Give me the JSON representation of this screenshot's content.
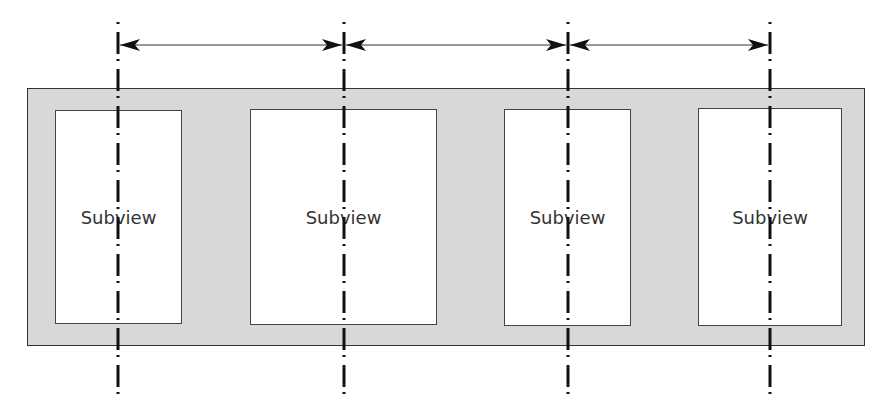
{
  "diagram": {
    "container": {
      "name": "superview",
      "fill": "#d8d8d8",
      "border": "#333333",
      "x": 27,
      "y": 88,
      "width": 838,
      "height": 258
    },
    "subviews": [
      {
        "label": "Subview",
        "x": 55,
        "y": 110,
        "width": 127,
        "height": 214,
        "center_x": 118
      },
      {
        "label": "Subview",
        "x": 250,
        "y": 109,
        "width": 187,
        "height": 216,
        "center_x": 344
      },
      {
        "label": "Subview",
        "x": 504,
        "y": 109,
        "width": 127,
        "height": 217,
        "center_x": 568
      },
      {
        "label": "Subview",
        "x": 698,
        "y": 108,
        "width": 144,
        "height": 218,
        "center_x": 770
      }
    ],
    "center_lines": {
      "style": "dash-dot",
      "color": "#111111",
      "y_top": 22,
      "y_bottom": 398,
      "x_positions": [
        118,
        344,
        568,
        770
      ]
    },
    "spacing_arrows": {
      "y": 45,
      "style": "double-headed",
      "segments": [
        {
          "from_x": 118,
          "to_x": 344
        },
        {
          "from_x": 344,
          "to_x": 568
        },
        {
          "from_x": 568,
          "to_x": 770
        }
      ]
    }
  }
}
